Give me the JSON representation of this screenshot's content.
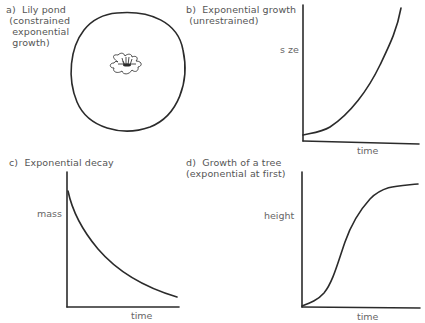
{
  "panels": {
    "a": {
      "label": "a)",
      "title_lines": [
        "Lily pond",
        "(constrained",
        "exponential",
        "growth)"
      ],
      "illustration": "lily-flower-in-pond"
    },
    "b": {
      "label": "b)",
      "title_lines": [
        "Exponential growth",
        "(unrestrained)"
      ],
      "ylabel": "s ze",
      "xlabel": "time"
    },
    "c": {
      "label": "c)",
      "title_lines": [
        "Exponential decay"
      ],
      "ylabel": "mass",
      "xlabel": "time"
    },
    "d": {
      "label": "d)",
      "title_lines": [
        "Growth of a tree",
        "(exponential at first)"
      ],
      "ylabel": "height",
      "xlabel": "time"
    }
  },
  "colors": {
    "ink": "#2b2b2b",
    "text": "#555555",
    "background": "#ffffff"
  }
}
